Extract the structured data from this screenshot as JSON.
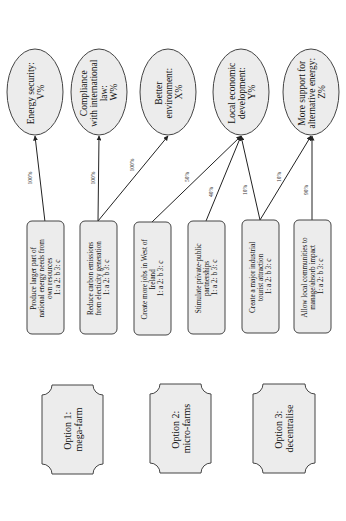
{
  "diagram": {
    "orientation": "rotated-90-ccw",
    "colors": {
      "shape_fill": "#ececec",
      "stroke": "#444444",
      "edge": "#222222",
      "background": "#ffffff"
    },
    "goals": [
      {
        "id": "g1",
        "lines": [
          "Energy security:",
          "V%"
        ]
      },
      {
        "id": "g2",
        "lines": [
          "Compliance",
          "with international",
          "law:",
          "W%"
        ]
      },
      {
        "id": "g3",
        "lines": [
          "Better",
          "environment:",
          "X%"
        ]
      },
      {
        "id": "g4",
        "lines": [
          "Local economic",
          "development:",
          "Y%"
        ]
      },
      {
        "id": "g5",
        "lines": [
          "More support for",
          "alternative energy:",
          "Z%"
        ]
      }
    ],
    "objectives": [
      {
        "id": "o1",
        "lines": [
          "Produce larger part of",
          "national energy needs from",
          "own resources",
          "1: a  2: b  3: c"
        ]
      },
      {
        "id": "o2",
        "lines": [
          "Reduce carbon emissions",
          "from electicity generation",
          "1: a  2: b  3: c"
        ]
      },
      {
        "id": "o3",
        "lines": [
          "Create more jobs in West of",
          "Ireland",
          "1: a  2: b  3: c"
        ]
      },
      {
        "id": "o4",
        "lines": [
          "Stimulate private-public",
          "partnerships",
          "1: a  2: b  3: c"
        ]
      },
      {
        "id": "o5",
        "lines": [
          "Create a major industrial",
          "tourist attraction",
          "1: a  2: b  3: c"
        ]
      },
      {
        "id": "o6",
        "lines": [
          "Allow local communities to",
          "manage/absorb impact",
          "1: a  2: b  3: c"
        ]
      }
    ],
    "edges": [
      {
        "from": "o1",
        "to": "g1",
        "weight": "100%"
      },
      {
        "from": "o2",
        "to": "g2",
        "weight": "100%"
      },
      {
        "from": "o2",
        "to": "g3",
        "weight": "100%"
      },
      {
        "from": "o3",
        "to": "g4",
        "weight": "50%"
      },
      {
        "from": "o4",
        "to": "g4",
        "weight": "40%"
      },
      {
        "from": "o5",
        "to": "g4",
        "weight": "10%"
      },
      {
        "from": "o5",
        "to": "g5",
        "weight": "10%"
      },
      {
        "from": "o6",
        "to": "g5",
        "weight": "90%"
      }
    ],
    "options": [
      {
        "id": "opt1",
        "lines": [
          "Option 1:",
          "mega-farm"
        ]
      },
      {
        "id": "opt2",
        "lines": [
          "Option 2:",
          "micro-farms"
        ]
      },
      {
        "id": "opt3",
        "lines": [
          "Option 3:",
          "decentralise"
        ]
      }
    ]
  }
}
